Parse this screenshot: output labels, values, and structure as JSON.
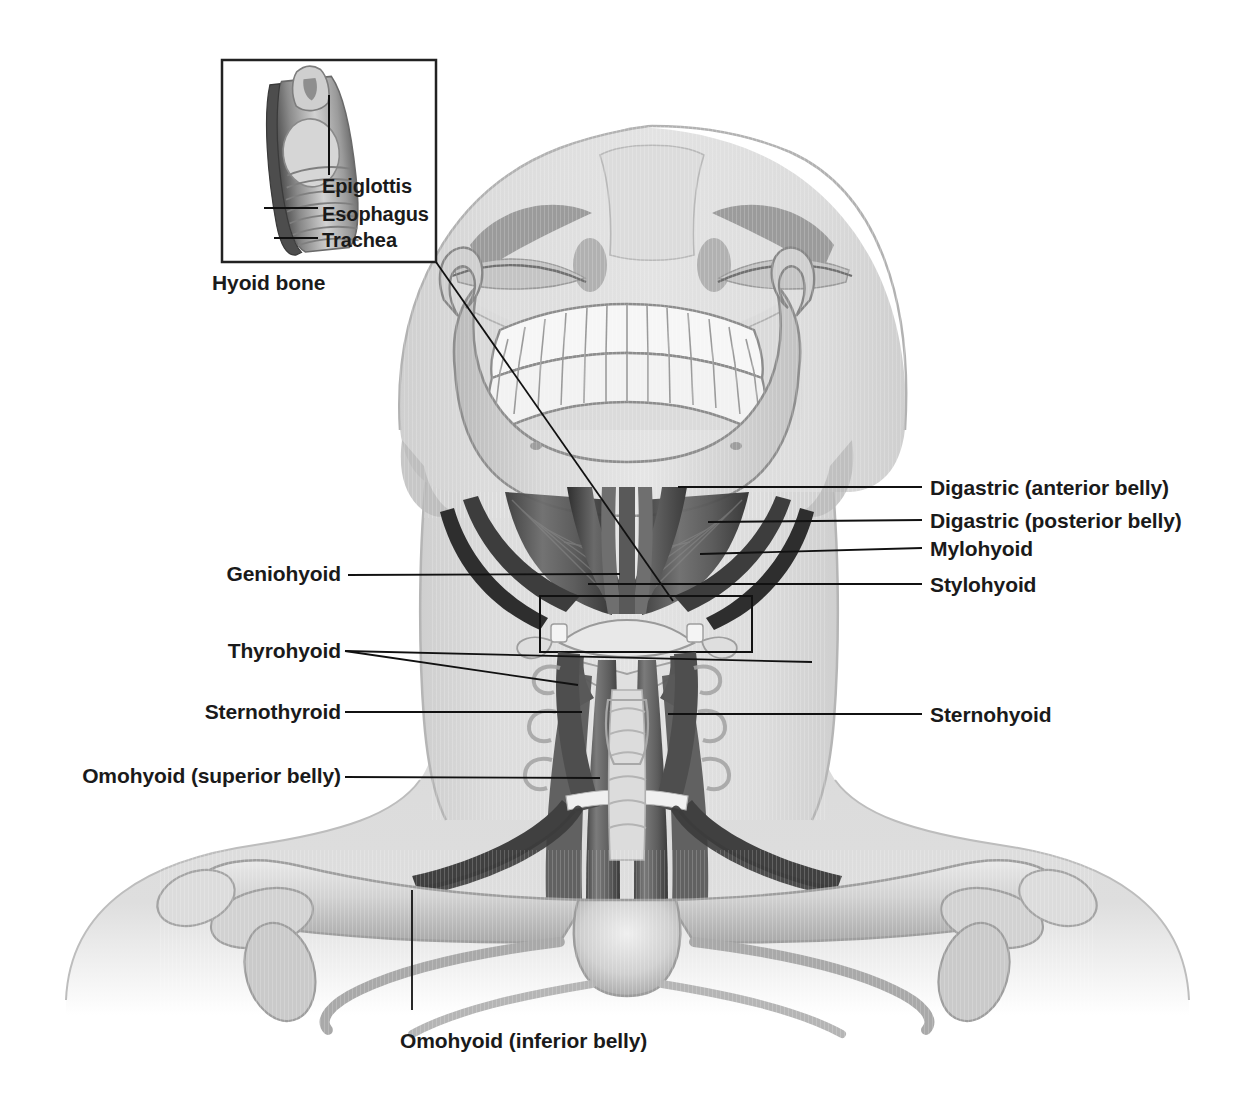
{
  "figure": {
    "background_color": "#ffffff",
    "line_color": "#111111",
    "text_color": "#1a1a1a",
    "illustration_tone_light": "#d6d6d6",
    "illustration_tone_mid": "#a8a8a8",
    "illustration_tone_dark": "#6b6b6b",
    "muscle_tone_dark": "#4a4a4a",
    "muscle_tone_darker": "#333333"
  },
  "inset": {
    "caption": "Hyoid bone",
    "border_color": "#222222",
    "labels": [
      {
        "id": "epiglottis",
        "text": "Epiglottis"
      },
      {
        "id": "esophagus",
        "text": "Esophagus"
      },
      {
        "id": "trachea",
        "text": "Trachea"
      }
    ]
  },
  "labels_right": [
    {
      "id": "digastric-anterior-belly",
      "text": "Digastric (anterior belly)"
    },
    {
      "id": "digastric-posterior-belly",
      "text": "Digastric (posterior belly)"
    },
    {
      "id": "mylohyoid",
      "text": "Mylohyoid"
    },
    {
      "id": "stylohyoid",
      "text": "Stylohyoid"
    },
    {
      "id": "sternohyoid",
      "text": "Sternohyoid"
    }
  ],
  "labels_left": [
    {
      "id": "geniohyoid",
      "text": "Geniohyoid"
    },
    {
      "id": "thyrohyoid",
      "text": "Thyrohyoid"
    },
    {
      "id": "sternothyroid",
      "text": "Sternothyroid"
    },
    {
      "id": "omohyoid-superior-belly",
      "text": "Omohyoid (superior belly)"
    }
  ],
  "labels_bottom": [
    {
      "id": "omohyoid-inferior-belly",
      "text": "Omohyoid (inferior belly)"
    }
  ]
}
